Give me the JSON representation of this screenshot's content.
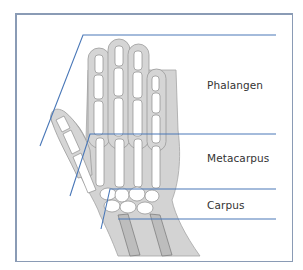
{
  "diagram": {
    "type": "anatomical illustration",
    "labels": [
      {
        "id": "phalangen",
        "text": "Phalangen",
        "x": 207,
        "y": 79
      },
      {
        "id": "metacarpus",
        "text": "Metacarpus",
        "x": 207,
        "y": 152
      },
      {
        "id": "carpus",
        "text": "Carpus",
        "x": 207,
        "y": 199
      }
    ],
    "colors": {
      "frame": "#8a9bb5",
      "leader_line": "#4a78b8",
      "skin": "#cfcfcf",
      "skin_outline": "#9a9a9a",
      "bone": "#ffffff",
      "text": "#333333"
    }
  }
}
